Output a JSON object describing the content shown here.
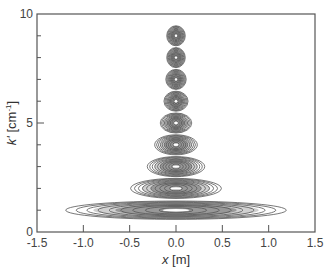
{
  "chart_data": {
    "type": "contour",
    "title": "",
    "xlabel": "x [m]",
    "xlabel_var": "x",
    "xlabel_unit": " [m]",
    "ylabel": "k' [cm-1]",
    "ylabel_var": "k'",
    "ylabel_unit_pre": " [cm",
    "ylabel_unit_sup": "-1",
    "ylabel_unit_post": "]",
    "xlim": [
      -1.5,
      1.5
    ],
    "ylim": [
      0,
      10
    ],
    "x_ticks": [
      "-1.5",
      "-1.0",
      "-0.5",
      "0.0",
      "0.5",
      "1.0",
      "1.5"
    ],
    "x_tick_values": [
      -1.5,
      -1.0,
      -0.5,
      0.0,
      0.5,
      1.0,
      1.5
    ],
    "y_ticks": [
      "0",
      "5",
      "10"
    ],
    "y_tick_values": [
      0,
      5,
      10
    ],
    "y_minor_ticks": [
      1,
      2,
      3,
      4,
      6,
      7,
      8,
      9
    ],
    "grid": false,
    "legend": null,
    "peaks": [
      {
        "k": 1,
        "x_center": 0.0,
        "outer_halfwidth_m": 1.19,
        "outer_halfheight_k": 0.42,
        "levels": 9
      },
      {
        "k": 2,
        "x_center": 0.0,
        "outer_halfwidth_m": 0.49,
        "outer_halfheight_k": 0.46,
        "levels": 10
      },
      {
        "k": 3,
        "x_center": 0.0,
        "outer_halfwidth_m": 0.31,
        "outer_halfheight_k": 0.46,
        "levels": 10
      },
      {
        "k": 4,
        "x_center": 0.0,
        "outer_halfwidth_m": 0.23,
        "outer_halfheight_k": 0.46,
        "levels": 10
      },
      {
        "k": 5,
        "x_center": 0.0,
        "outer_halfwidth_m": 0.17,
        "outer_halfheight_k": 0.46,
        "levels": 10
      },
      {
        "k": 6,
        "x_center": 0.0,
        "outer_halfwidth_m": 0.13,
        "outer_halfheight_k": 0.46,
        "levels": 10
      },
      {
        "k": 7,
        "x_center": 0.0,
        "outer_halfwidth_m": 0.11,
        "outer_halfheight_k": 0.46,
        "levels": 10
      },
      {
        "k": 8,
        "x_center": 0.0,
        "outer_halfwidth_m": 0.1,
        "outer_halfheight_k": 0.46,
        "levels": 10
      },
      {
        "k": 9,
        "x_center": 0.0,
        "outer_halfwidth_m": 0.1,
        "outer_halfheight_k": 0.46,
        "levels": 10
      }
    ]
  },
  "style": {
    "axis_color": "#555555",
    "contour_color": "#555555",
    "background": "#ffffff"
  }
}
